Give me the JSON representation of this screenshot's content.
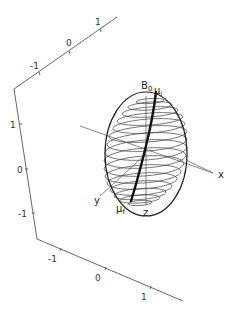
{
  "figure": {
    "type": "3d-spin-sphere-diagram",
    "axes_box": {
      "top_axis_ticks": [
        "-1",
        "0",
        "1"
      ],
      "left_axis_ticks": [
        "1",
        "0",
        "-1"
      ],
      "bottom_axis_ticks": [
        "-1",
        "0",
        "1"
      ]
    },
    "labels": {
      "b0_main": "B",
      "b0_sub": "0",
      "mu_i_main": "μ",
      "mu_i_sub": "i",
      "mu_f_main": "μ",
      "mu_f_sub": "f",
      "x": "x",
      "y": "y",
      "z": "z"
    },
    "sphere": {
      "ring_count": 16,
      "center": [
        146,
        154
      ],
      "rx": 40,
      "ry": 63
    },
    "colors": {
      "lines": "#222222",
      "axes": "#555555",
      "background": "#ffffff"
    }
  }
}
